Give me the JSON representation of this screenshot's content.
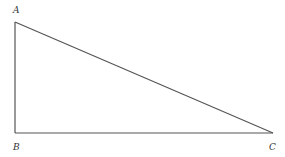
{
  "diagram": {
    "type": "right-triangle",
    "vertices": [
      {
        "label": "A",
        "x": 15,
        "y": 22,
        "lx": 13,
        "ly": 13
      },
      {
        "label": "B",
        "x": 15,
        "y": 133,
        "lx": 13,
        "ly": 150
      },
      {
        "label": "C",
        "x": 273,
        "y": 133,
        "lx": 269,
        "ly": 150
      }
    ],
    "line_color": "#555555"
  }
}
